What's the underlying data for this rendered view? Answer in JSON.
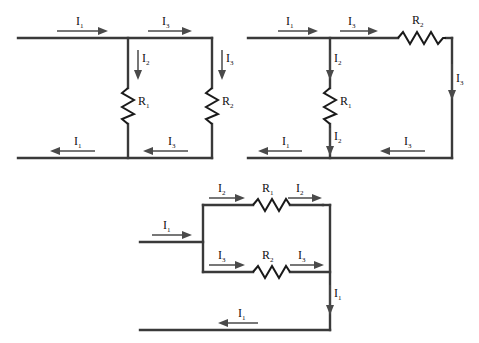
{
  "figure": {
    "type": "circuit-diagram",
    "background": "#ffffff",
    "wire_color": "#3a3a3a",
    "label_color": "#111111",
    "arrow_color": "#4a4a4a"
  },
  "circuits": [
    {
      "id": "circuit-1",
      "name": "two-parallel-resistor-ladder",
      "components": [
        {
          "name": "resistor-r1",
          "label": "R",
          "sub": "1",
          "orientation": "vertical"
        },
        {
          "name": "resistor-r2",
          "label": "R",
          "sub": "2",
          "orientation": "vertical"
        }
      ],
      "currents": [
        {
          "name": "top-left-current",
          "label": "I",
          "sub": "1",
          "direction": "right"
        },
        {
          "name": "top-right-current",
          "label": "I",
          "sub": "3",
          "direction": "right"
        },
        {
          "name": "r1-branch-current",
          "label": "I",
          "sub": "2",
          "direction": "down"
        },
        {
          "name": "r2-branch-current",
          "label": "I",
          "sub": "3",
          "direction": "down"
        },
        {
          "name": "bottom-left-current",
          "label": "I",
          "sub": "1",
          "direction": "left"
        },
        {
          "name": "bottom-right-current",
          "label": "I",
          "sub": "3",
          "direction": "left"
        }
      ]
    },
    {
      "id": "circuit-2",
      "name": "series-parallel-ladder",
      "components": [
        {
          "name": "resistor-r1",
          "label": "R",
          "sub": "1",
          "orientation": "vertical"
        },
        {
          "name": "resistor-r2",
          "label": "R",
          "sub": "2",
          "orientation": "horizontal"
        }
      ],
      "currents": [
        {
          "name": "top-left-current",
          "label": "I",
          "sub": "1",
          "direction": "right"
        },
        {
          "name": "top-middle-current",
          "label": "I",
          "sub": "3",
          "direction": "right"
        },
        {
          "name": "r1-top-current",
          "label": "I",
          "sub": "2",
          "direction": "down"
        },
        {
          "name": "r1-bottom-current",
          "label": "I",
          "sub": "2",
          "direction": "down"
        },
        {
          "name": "right-branch-current",
          "label": "I",
          "sub": "3",
          "direction": "down"
        },
        {
          "name": "bottom-left-current",
          "label": "I",
          "sub": "1",
          "direction": "left"
        },
        {
          "name": "bottom-right-current",
          "label": "I",
          "sub": "3",
          "direction": "left"
        }
      ]
    },
    {
      "id": "circuit-3",
      "name": "parallel-branch-network",
      "components": [
        {
          "name": "resistor-r1",
          "label": "R",
          "sub": "1",
          "orientation": "horizontal"
        },
        {
          "name": "resistor-r2",
          "label": "R",
          "sub": "2",
          "orientation": "horizontal"
        }
      ],
      "currents": [
        {
          "name": "input-current",
          "label": "I",
          "sub": "1",
          "direction": "right"
        },
        {
          "name": "top-branch-in-current",
          "label": "I",
          "sub": "2",
          "direction": "right"
        },
        {
          "name": "top-branch-out-current",
          "label": "I",
          "sub": "2",
          "direction": "right"
        },
        {
          "name": "bot-branch-in-current",
          "label": "I",
          "sub": "3",
          "direction": "right"
        },
        {
          "name": "bot-branch-out-current",
          "label": "I",
          "sub": "3",
          "direction": "right"
        },
        {
          "name": "right-return-current",
          "label": "I",
          "sub": "1",
          "direction": "down"
        },
        {
          "name": "bottom-return-current",
          "label": "I",
          "sub": "1",
          "direction": "left"
        }
      ]
    }
  ]
}
